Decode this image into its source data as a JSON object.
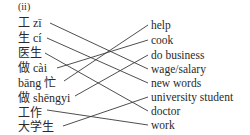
{
  "exercise": {
    "label": "(ii)",
    "left_items": [
      {
        "text": "工 zī"
      },
      {
        "text": "生 cí"
      },
      {
        "text": "医生"
      },
      {
        "text": "做 cài"
      },
      {
        "text": "bāng 忙"
      },
      {
        "text": "做 shēngyi"
      },
      {
        "text": "工作"
      },
      {
        "text": "大学生"
      }
    ],
    "right_items": [
      {
        "text": "help"
      },
      {
        "text": "cook"
      },
      {
        "text": "do business"
      },
      {
        "text": "wage/salary"
      },
      {
        "text": "new words"
      },
      {
        "text": "university student"
      },
      {
        "text": "doctor"
      },
      {
        "text": "work"
      }
    ],
    "matches": [
      {
        "left": "工 zī",
        "right": "wage/salary"
      },
      {
        "left": "生 cí",
        "right": "new words"
      },
      {
        "left": "医生",
        "right": "doctor"
      },
      {
        "left": "做 cài",
        "right": "cook"
      },
      {
        "left": "bāng 忙",
        "right": "help"
      },
      {
        "left": "做 shēngyi",
        "right": "do business"
      },
      {
        "left": "工作",
        "right": "work"
      },
      {
        "left": "大学生",
        "right": "university student"
      }
    ]
  }
}
